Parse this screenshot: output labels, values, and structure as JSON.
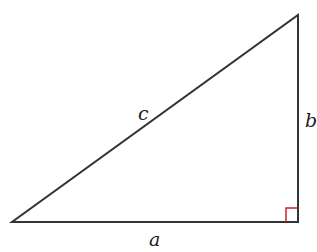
{
  "diagram": {
    "type": "right-triangle",
    "labels": {
      "hypotenuse": "c",
      "vertical_leg": "b",
      "horizontal_leg": "a"
    },
    "vertices": {
      "bottom_left": [
        12,
        222
      ],
      "bottom_right": [
        298,
        222
      ],
      "top_right": [
        298,
        15
      ]
    },
    "right_angle_marker": {
      "position": "bottom-right",
      "size": 12
    },
    "colors": {
      "stroke": "#333333",
      "right_angle": "#cc2222",
      "label": "#222222"
    }
  }
}
